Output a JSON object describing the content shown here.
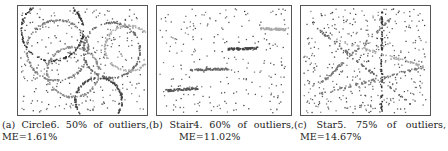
{
  "figure": {
    "panels": [
      {
        "label": "(a)",
        "name": "Circle6.",
        "outliers": "50%",
        "of_outliers": "of",
        "outliers_word": "outliers,",
        "me": "ME=1.61%",
        "structure": "six circular arcs",
        "structures": [
          {
            "type": "circle",
            "cx": 0.26,
            "cy": 0.22,
            "r": 0.24,
            "shade": "#333"
          },
          {
            "type": "circle",
            "cx": 0.3,
            "cy": 0.4,
            "r": 0.24,
            "shade": "#777"
          },
          {
            "type": "circle",
            "cx": 0.42,
            "cy": 0.6,
            "r": 0.2,
            "shade": "#888"
          },
          {
            "type": "circle",
            "cx": 0.72,
            "cy": 0.4,
            "r": 0.22,
            "shade": "#666"
          },
          {
            "type": "circle",
            "cx": 0.85,
            "cy": 0.38,
            "r": 0.18,
            "shade": "#aaa"
          },
          {
            "type": "circle",
            "cx": 0.62,
            "cy": 0.86,
            "r": 0.18,
            "shade": "#444"
          }
        ]
      },
      {
        "label": "(b)",
        "name": "Stair4.",
        "outliers": "60%",
        "of_outliers": "of",
        "outliers_word": "outliers,",
        "me": "ME=11.02%",
        "structure": "four horizontal stair segments",
        "structures": [
          {
            "type": "segment",
            "x1": 0.05,
            "y1": 0.77,
            "x2": 0.3,
            "y2": 0.75,
            "shade": "#555"
          },
          {
            "type": "segment",
            "x1": 0.24,
            "y1": 0.58,
            "x2": 0.52,
            "y2": 0.57,
            "shade": "#666"
          },
          {
            "type": "segment",
            "x1": 0.52,
            "y1": 0.39,
            "x2": 0.75,
            "y2": 0.38,
            "shade": "#444"
          },
          {
            "type": "segment",
            "x1": 0.77,
            "y1": 0.2,
            "x2": 0.95,
            "y2": 0.21,
            "shade": "#aaa"
          }
        ]
      },
      {
        "label": "(c)",
        "name": "Star5.",
        "outliers": "75%",
        "of_outliers": "of",
        "outliers_word": "outliers,",
        "me": "ME=14.67%",
        "structure": "five lines through a common center (star)",
        "structures": [
          {
            "type": "segment",
            "x1": 0.62,
            "y1": 0.05,
            "x2": 0.62,
            "y2": 0.95,
            "shade": "#333"
          },
          {
            "type": "segment",
            "x1": 0.12,
            "y1": 0.2,
            "x2": 0.85,
            "y2": 0.9,
            "shade": "#666"
          },
          {
            "type": "segment",
            "x1": 0.08,
            "y1": 0.82,
            "x2": 0.95,
            "y2": 0.55,
            "shade": "#777"
          },
          {
            "type": "segment",
            "x1": 0.15,
            "y1": 0.7,
            "x2": 0.7,
            "y2": 0.1,
            "shade": "#777"
          },
          {
            "type": "segment",
            "x1": 0.25,
            "y1": 0.3,
            "x2": 0.95,
            "y2": 0.55,
            "shade": "#aaa"
          }
        ]
      }
    ]
  }
}
